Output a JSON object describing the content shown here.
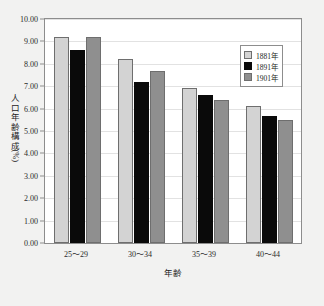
{
  "chart_data": {
    "type": "bar",
    "title": "",
    "subtitle": "",
    "xlabel": "年齢",
    "ylabel": "人口年齢構成（%）",
    "categories": [
      "25～29",
      "30～34",
      "35～39",
      "40～44"
    ],
    "series": [
      {
        "name": "1881年",
        "color": "#d3d3d3",
        "values": [
          9.2,
          8.2,
          6.9,
          6.1
        ]
      },
      {
        "name": "1891年",
        "color": "#0a0a0a",
        "values": [
          8.6,
          7.2,
          6.6,
          5.65
        ]
      },
      {
        "name": "1901年",
        "color": "#8f8f8f",
        "values": [
          9.2,
          7.7,
          6.4,
          5.5
        ]
      }
    ],
    "ylim": [
      0,
      10
    ],
    "ytick_step": 1,
    "ytick_labels": [
      "0.00",
      "1.00",
      "2.00",
      "3.00",
      "4.00",
      "5.00",
      "6.00",
      "7.00",
      "8.00",
      "9.00",
      "10.00"
    ],
    "grid": true,
    "legend_position": "top-right"
  },
  "legend": {
    "entries": [
      "1881年",
      "1891年",
      "1901年"
    ]
  },
  "axis": {
    "y_title_chars": [
      "人",
      "口",
      "年",
      "齢",
      "構",
      "成",
      "（%）"
    ],
    "x_title": "年齢"
  }
}
